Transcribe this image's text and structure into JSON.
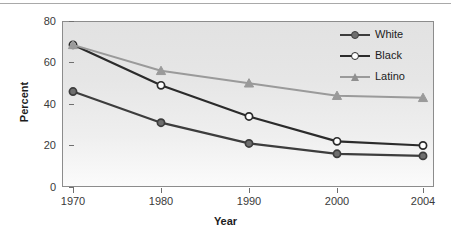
{
  "chart_data": {
    "type": "line",
    "title": "",
    "xlabel": "Year",
    "ylabel": "Percent",
    "categories": [
      "1970",
      "1980",
      "1990",
      "2000",
      "2004"
    ],
    "x_tick_labels": [
      "1970",
      "1980",
      "1990",
      "2000",
      "2004"
    ],
    "y_tick_labels": [
      "0",
      "20",
      "40",
      "60",
      "80"
    ],
    "y_ticks": [
      0,
      20,
      40,
      60,
      80
    ],
    "ylim": [
      0,
      80
    ],
    "grid": false,
    "legend_position": "top-right",
    "series": [
      {
        "name": "White",
        "values": [
          46,
          31,
          21,
          16,
          15
        ],
        "color": "#3d3d3d",
        "marker": "filled-circle",
        "marker_fill": "#6e6e6e"
      },
      {
        "name": "Black",
        "values": [
          68.5,
          49,
          34,
          22,
          20
        ],
        "color": "#2b2b2b",
        "marker": "open-circle",
        "marker_fill": "#ffffff"
      },
      {
        "name": "Latino",
        "values": [
          68.5,
          56,
          50,
          44,
          43
        ],
        "color": "#9a9a9a",
        "marker": "filled-triangle",
        "marker_fill": "#9a9a9a"
      }
    ]
  },
  "legend": {
    "entries": [
      {
        "label": "White"
      },
      {
        "label": "Black"
      },
      {
        "label": "Latino"
      }
    ]
  },
  "axes": {
    "x_title": "Year",
    "y_title": "Percent"
  },
  "colors": {
    "plot_border": "#8c8c8c",
    "tick": "#6f6f6f",
    "text": "#1c1c1c",
    "top_rule": "#a9a9a9"
  }
}
